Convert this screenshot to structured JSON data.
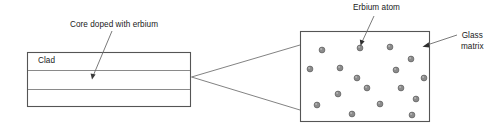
{
  "diagram": {
    "colors": {
      "outline": "#555555",
      "divider": "#8a8a8a",
      "leader": "#6b6b6b",
      "atom_fill": "#8c8c8c",
      "atom_stroke": "#5a5a5a",
      "text": "#1a1a1a",
      "background": "#ffffff"
    },
    "labels": {
      "core": "Core doped with erbium",
      "clad": "Clad",
      "erbium_atom": "Erbium atom",
      "glass_matrix_line1": "Glass",
      "glass_matrix_line2": "matrix"
    },
    "fiber": {
      "x": 27,
      "y": 52,
      "width": 164,
      "height": 55,
      "divider_y": [
        70,
        89
      ],
      "clad_label_x": 38,
      "clad_label_y": 56
    },
    "matrix": {
      "x": 300,
      "y": 31,
      "width": 130,
      "height": 91,
      "atom_radius": 2.9,
      "atom_count": 17,
      "atoms": [
        {
          "cx": 322,
          "cy": 50
        },
        {
          "cx": 360,
          "cy": 48
        },
        {
          "cx": 390,
          "cy": 47
        },
        {
          "cx": 411,
          "cy": 59
        },
        {
          "cx": 310,
          "cy": 69
        },
        {
          "cx": 340,
          "cy": 68
        },
        {
          "cx": 396,
          "cy": 70
        },
        {
          "cx": 357,
          "cy": 78
        },
        {
          "cx": 424,
          "cy": 78
        },
        {
          "cx": 367,
          "cy": 88
        },
        {
          "cx": 401,
          "cy": 88
        },
        {
          "cx": 338,
          "cy": 94
        },
        {
          "cx": 317,
          "cy": 105
        },
        {
          "cx": 380,
          "cy": 104
        },
        {
          "cx": 416,
          "cy": 99
        },
        {
          "cx": 352,
          "cy": 114
        },
        {
          "cx": 412,
          "cy": 115
        }
      ]
    },
    "leaders": {
      "core_arrow": {
        "x1": 112,
        "y1": 31,
        "x2": 92,
        "y2": 79
      },
      "erbium_arrow": {
        "x1": 374,
        "y1": 16,
        "x2": 361,
        "y2": 45
      },
      "glass_leader": {
        "x1": 456,
        "y1": 36,
        "x2": 422,
        "y2": 47
      },
      "expand_top": {
        "x1": 192,
        "y1": 77,
        "x2": 300,
        "y2": 45
      },
      "expand_bottom": {
        "x1": 192,
        "y1": 77,
        "x2": 300,
        "y2": 110
      }
    },
    "label_positions": {
      "core": {
        "x": 70,
        "y": 20
      },
      "erbium_atom": {
        "x": 353,
        "y": 3
      },
      "glass_matrix": {
        "x": 461,
        "y": 31
      }
    }
  }
}
